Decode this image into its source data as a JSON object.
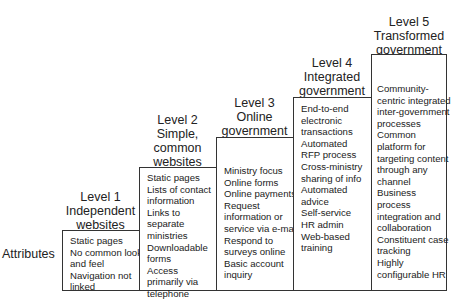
{
  "row_label": "Attributes",
  "levels": [
    {
      "title_lines": [
        "Level 1",
        "Independent",
        "websites"
      ],
      "attributes": [
        "Static pages",
        "No common look",
        "and feel",
        "Navigation not",
        "linked"
      ]
    },
    {
      "title_lines": [
        "Level 2",
        "Simple,",
        "common",
        "websites"
      ],
      "attributes": [
        "Static pages",
        "Lists of contact",
        "information",
        "Links to",
        "separate",
        "ministries",
        "Downloadable",
        "forms",
        "Access",
        "primarily via",
        "telephone"
      ]
    },
    {
      "title_lines": [
        "Level 3",
        "Online",
        "government"
      ],
      "attributes": [
        "Ministry focus",
        "Online forms",
        "Online payments",
        "Request",
        "information or",
        "service via e-mail",
        "Respond to",
        "surveys online",
        "Basic account",
        "inquiry"
      ]
    },
    {
      "title_lines": [
        "Level 4",
        "Integrated",
        "government"
      ],
      "attributes": [
        "End-to-end",
        "electronic",
        "transactions",
        "Automated",
        "RFP process",
        "Cross-ministry",
        "sharing of info",
        "Automated",
        "advice",
        "Self-service",
        "HR admin",
        "Web-based",
        "training"
      ]
    },
    {
      "title_lines": [
        "Level 5",
        "Transformed",
        "government"
      ],
      "attributes": [
        "Community-",
        "centric integrated",
        "inter-government",
        "processes",
        "Common",
        "platform for",
        "targeting content",
        "through any",
        "channel",
        "Business",
        "process",
        "integration and",
        "collaboration",
        "Constituent case",
        "tracking",
        "Highly",
        "configurable HR"
      ]
    }
  ]
}
